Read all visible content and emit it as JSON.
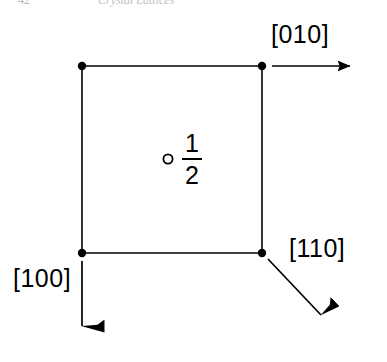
{
  "page": {
    "background_color": "#ffffff",
    "ink_color": "#000000",
    "width": 387,
    "height": 362
  },
  "header": {
    "folio": "42",
    "running_title": "Crystal Lattices",
    "color": "#bdbdbd",
    "clipped": true
  },
  "figure": {
    "type": "crystal-lattice-projection",
    "square": {
      "left": 82,
      "top": 66,
      "right": 262,
      "bottom": 253,
      "stroke_width": 1.6,
      "corner_dot_radius": 4.2
    },
    "center_atom": {
      "symbol": "open-circle",
      "cx": 168,
      "cy": 159,
      "r": 4.6,
      "stroke_width": 1.8,
      "height_label_numerator": "1",
      "height_label_denominator": "2"
    },
    "directions": [
      {
        "id": "010",
        "label": "[010]",
        "arrow_from_x": 262,
        "arrow_from_y": 66,
        "arrow_to_x": 362,
        "arrow_to_y": 66,
        "orientation": "right"
      },
      {
        "id": "100",
        "label": "[100]",
        "arrow_from_x": 82,
        "arrow_from_y": 253,
        "arrow_to_x": 82,
        "arrow_to_y": 348,
        "orientation": "down"
      },
      {
        "id": "110",
        "label": "[110]",
        "arrow_from_x": 262,
        "arrow_from_y": 253,
        "arrow_to_x": 331,
        "arrow_to_y": 326,
        "orientation": "down-right-diagonal"
      }
    ]
  }
}
